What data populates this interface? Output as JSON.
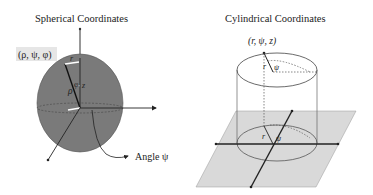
{
  "spherical": {
    "title": "Spherical Coordinates",
    "point_label": "(ρ, ψ, φ)",
    "rho_label": "ρ",
    "r_label": "r",
    "z_label": "z",
    "phi_label": "φ",
    "angle_label": "Angle ψ",
    "colors": {
      "sphere_fill": "#7a7a7a",
      "label_bg": "#e6e6e6"
    }
  },
  "cylindrical": {
    "title": "Cylindrical Coordinates",
    "point_label": "(r, ψ, z)",
    "r_top_label": "r",
    "psi_top_label": "ψ",
    "r_bottom_label": "r",
    "psi_bottom_label": "ψ",
    "colors": {
      "plane_fill": "#d9d9d9",
      "axis": "#222222"
    }
  }
}
